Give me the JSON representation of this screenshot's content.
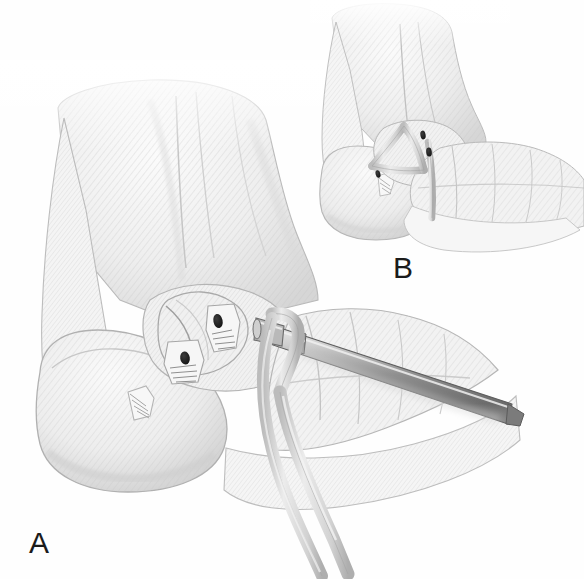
{
  "figure": {
    "type": "medical-illustration",
    "style": "grayscale pencil rendering",
    "background_color": "#fefefe",
    "width": 584,
    "height": 579,
    "panels": [
      {
        "id": "A",
        "label": "A",
        "label_x": 29,
        "label_y": 528,
        "caption_text": "A",
        "description": "Lateral view of ankle and foot with drill guide inserted and tendon graft passed through bone tunnels",
        "view": "lateral",
        "region_x": 0,
        "region_y": 60,
        "region_width": 520,
        "region_height": 519,
        "structures": [
          {
            "name": "tibia",
            "kind": "bone"
          },
          {
            "name": "fibula",
            "kind": "bone"
          },
          {
            "name": "lateral-malleolus",
            "kind": "bone"
          },
          {
            "name": "talus",
            "kind": "bone"
          },
          {
            "name": "calcaneus",
            "kind": "bone"
          },
          {
            "name": "navicular",
            "kind": "bone"
          },
          {
            "name": "cuboid",
            "kind": "bone"
          },
          {
            "name": "metatarsals",
            "kind": "bone"
          },
          {
            "name": "fibular-bone-tunnel-superior",
            "kind": "drill-hole"
          },
          {
            "name": "fibular-bone-tunnel-inferior",
            "kind": "drill-hole"
          },
          {
            "name": "tendon-graft-strand-anterior",
            "kind": "graft"
          },
          {
            "name": "tendon-graft-strand-posterior",
            "kind": "graft"
          },
          {
            "name": "cannulated-drill-guide",
            "kind": "instrument"
          },
          {
            "name": "drill-guide-collar",
            "kind": "instrument"
          }
        ]
      },
      {
        "id": "B",
        "label": "B",
        "label_x": 393,
        "label_y": 253,
        "caption_text": "B",
        "description": "Completed reconstruction showing triangular graft configuration secured through bone tunnels",
        "view": "lateral",
        "region_x": 310,
        "region_y": 0,
        "region_width": 274,
        "region_height": 250,
        "structures": [
          {
            "name": "tibia",
            "kind": "bone"
          },
          {
            "name": "fibula",
            "kind": "bone"
          },
          {
            "name": "lateral-malleolus",
            "kind": "bone"
          },
          {
            "name": "talus",
            "kind": "bone"
          },
          {
            "name": "calcaneus",
            "kind": "bone"
          },
          {
            "name": "navicular",
            "kind": "bone"
          },
          {
            "name": "metatarsals",
            "kind": "bone"
          },
          {
            "name": "talar-bone-tunnel",
            "kind": "drill-hole"
          },
          {
            "name": "calcaneal-bone-tunnel",
            "kind": "drill-hole"
          },
          {
            "name": "reconstructed-graft-triangle",
            "kind": "graft"
          }
        ]
      }
    ],
    "palette": {
      "background": "#fefefe",
      "bone_light": "#f3f3f3",
      "bone_mid": "#e2e2e2",
      "bone_shadow": "#c9c9c9",
      "outline": "#a8a8a8",
      "outline_dark": "#8d8d8d",
      "hatch": "#bdbdbd",
      "graft": "#d8d8d8",
      "graft_edge": "#9a9a9a",
      "instrument_light": "#dcdcdc",
      "instrument_mid": "#a9a9a9",
      "instrument_dark": "#6e6e6e",
      "drill_hole": "#242424",
      "label_text": "#1b1b1b"
    }
  }
}
